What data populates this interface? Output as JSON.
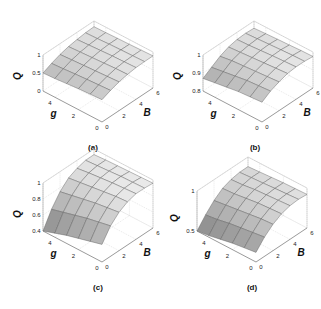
{
  "chart_data": [
    {
      "type": "surface",
      "caption": "(a)",
      "xlabel": "g",
      "ylabel": "B",
      "zlabel": "Q",
      "x_ticks": [
        "0",
        "2",
        "4"
      ],
      "y_ticks": [
        "0",
        "2",
        "4",
        "6"
      ],
      "z_ticks": [
        "0",
        "0.5",
        "1"
      ],
      "xlim": [
        0,
        5
      ],
      "ylim": [
        0,
        6
      ],
      "zlim": [
        0,
        1
      ],
      "z_tick_values": [
        0,
        0.5,
        1
      ],
      "surface": {
        "z_at_gmax_B0": 0.5,
        "z_peak": 0.9,
        "shape": "rises with B, saturating; mild increase with decreasing g"
      },
      "grid_g": [
        0,
        1,
        2,
        3,
        4,
        5
      ],
      "grid_B": [
        0,
        1,
        2,
        3,
        4,
        5,
        6
      ],
      "z": [
        [
          0.62,
          0.72,
          0.8,
          0.85,
          0.88,
          0.89,
          0.89
        ],
        [
          0.6,
          0.7,
          0.78,
          0.84,
          0.87,
          0.88,
          0.88
        ],
        [
          0.58,
          0.68,
          0.76,
          0.82,
          0.86,
          0.87,
          0.87
        ],
        [
          0.55,
          0.66,
          0.74,
          0.8,
          0.84,
          0.86,
          0.86
        ],
        [
          0.52,
          0.63,
          0.72,
          0.78,
          0.82,
          0.84,
          0.85
        ],
        [
          0.5,
          0.61,
          0.7,
          0.76,
          0.8,
          0.83,
          0.84
        ]
      ]
    },
    {
      "type": "surface",
      "caption": "(b)",
      "xlabel": "g",
      "ylabel": "B",
      "zlabel": "Q",
      "x_ticks": [
        "0",
        "2",
        "4"
      ],
      "y_ticks": [
        "0",
        "2",
        "4",
        "6"
      ],
      "z_ticks": [
        "0.8",
        "0.9",
        "1"
      ],
      "xlim": [
        0,
        5
      ],
      "ylim": [
        0,
        6
      ],
      "zlim": [
        0.8,
        1
      ],
      "z_tick_values": [
        0.8,
        0.9,
        1
      ],
      "surface": {
        "z_at_gmax_B0": 0.87,
        "z_peak": 0.98,
        "shape": "rises with B, saturating"
      },
      "grid_g": [
        0,
        1,
        2,
        3,
        4,
        5
      ],
      "grid_B": [
        0,
        1,
        2,
        3,
        4,
        5,
        6
      ],
      "z": [
        [
          0.91,
          0.94,
          0.96,
          0.975,
          0.98,
          0.98,
          0.975
        ],
        [
          0.905,
          0.935,
          0.955,
          0.97,
          0.977,
          0.978,
          0.973
        ],
        [
          0.9,
          0.93,
          0.95,
          0.965,
          0.973,
          0.975,
          0.97
        ],
        [
          0.89,
          0.92,
          0.945,
          0.96,
          0.968,
          0.971,
          0.967
        ],
        [
          0.88,
          0.91,
          0.94,
          0.955,
          0.963,
          0.967,
          0.964
        ],
        [
          0.87,
          0.9,
          0.93,
          0.95,
          0.96,
          0.963,
          0.96
        ]
      ]
    },
    {
      "type": "surface",
      "caption": "(c)",
      "xlabel": "g",
      "ylabel": "B",
      "zlabel": "Q",
      "x_ticks": [
        "0",
        "2",
        "4"
      ],
      "y_ticks": [
        "0",
        "2",
        "4",
        "6"
      ],
      "z_ticks": [
        "0.4",
        "0.6",
        "0.8",
        "1"
      ],
      "xlim": [
        0,
        5
      ],
      "ylim": [
        0,
        6
      ],
      "zlim": [
        0.4,
        1
      ],
      "z_tick_values": [
        0.4,
        0.6,
        0.8,
        1
      ],
      "surface": {
        "z_at_gmax_B0": 0.4,
        "z_peak": 0.97,
        "shape": "strongly rises with B, saturating"
      },
      "grid_g": [
        0,
        1,
        2,
        3,
        4,
        5
      ],
      "grid_B": [
        0,
        1,
        2,
        3,
        4,
        5,
        6
      ],
      "z": [
        [
          0.62,
          0.78,
          0.88,
          0.94,
          0.97,
          0.97,
          0.96
        ],
        [
          0.58,
          0.75,
          0.86,
          0.93,
          0.96,
          0.965,
          0.955
        ],
        [
          0.54,
          0.72,
          0.84,
          0.91,
          0.95,
          0.96,
          0.95
        ],
        [
          0.5,
          0.68,
          0.81,
          0.89,
          0.935,
          0.95,
          0.945
        ],
        [
          0.45,
          0.64,
          0.78,
          0.87,
          0.92,
          0.94,
          0.94
        ],
        [
          0.4,
          0.6,
          0.75,
          0.85,
          0.9,
          0.93,
          0.93
        ]
      ]
    },
    {
      "type": "surface",
      "caption": "(d)",
      "xlabel": "g",
      "ylabel": "B",
      "zlabel": "Q",
      "x_ticks": [
        "0",
        "2",
        "4"
      ],
      "y_ticks": [
        "0",
        "2",
        "4",
        "6"
      ],
      "z_ticks": [
        "0.5",
        "1"
      ],
      "xlim": [
        0,
        5
      ],
      "ylim": [
        0,
        6
      ],
      "zlim": [
        0.5,
        1
      ],
      "z_tick_values": [
        0.5,
        1
      ],
      "surface": {
        "z_at_gmax_B0": 0.5,
        "z_peak": 0.92,
        "shape": "rises with B, saturating"
      },
      "grid_g": [
        0,
        1,
        2,
        3,
        4,
        5
      ],
      "grid_B": [
        0,
        1,
        2,
        3,
        4,
        5,
        6
      ],
      "z": [
        [
          0.62,
          0.74,
          0.83,
          0.89,
          0.92,
          0.93,
          0.92
        ],
        [
          0.6,
          0.72,
          0.82,
          0.88,
          0.91,
          0.92,
          0.915
        ],
        [
          0.58,
          0.7,
          0.8,
          0.87,
          0.9,
          0.91,
          0.91
        ],
        [
          0.55,
          0.68,
          0.78,
          0.85,
          0.89,
          0.9,
          0.9
        ],
        [
          0.52,
          0.65,
          0.76,
          0.83,
          0.87,
          0.89,
          0.89
        ],
        [
          0.5,
          0.63,
          0.74,
          0.82,
          0.86,
          0.88,
          0.88
        ]
      ]
    }
  ]
}
